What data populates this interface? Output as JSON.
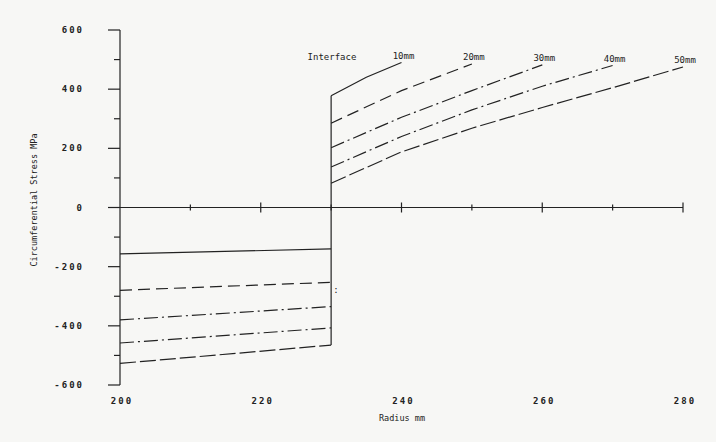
{
  "chart_data": {
    "type": "line",
    "title": "",
    "xlabel": "Radius mm",
    "ylabel": "Circumferential Stress MPa",
    "xlim": [
      200,
      280
    ],
    "ylim": [
      -600,
      600
    ],
    "x_ticks": [
      200,
      210,
      220,
      230,
      240,
      250,
      260,
      270,
      280
    ],
    "x_tick_labels": [
      "200",
      "220",
      "240",
      "260",
      "280"
    ],
    "x_tick_label_values": [
      200,
      220,
      240,
      260,
      280
    ],
    "y_ticks": [
      -600,
      -500,
      -400,
      -300,
      -200,
      -100,
      0,
      100,
      200,
      300,
      400,
      500,
      600
    ],
    "y_tick_labels": [
      "-600",
      "-400",
      "-200",
      "0",
      "200",
      "400",
      "600"
    ],
    "y_tick_label_values": [
      -600,
      -400,
      -200,
      0,
      200,
      400,
      600
    ],
    "grid": false,
    "interface_radius": 230,
    "interface_label": "Interface",
    "series": [
      {
        "name": "10mm",
        "dash": "solid",
        "inner": {
          "x": [
            200,
            230
          ],
          "y": [
            -157,
            -140
          ]
        },
        "outer": {
          "x": [
            230,
            235,
            240
          ],
          "y": [
            378,
            440,
            490
          ]
        }
      },
      {
        "name": "20mm",
        "dash": "dashed",
        "inner": {
          "x": [
            200,
            230
          ],
          "y": [
            -280,
            -253
          ]
        },
        "outer": {
          "x": [
            230,
            240,
            250
          ],
          "y": [
            285,
            395,
            485
          ]
        }
      },
      {
        "name": "30mm",
        "dash": "dash-dot",
        "inner": {
          "x": [
            200,
            230
          ],
          "y": [
            -380,
            -335
          ]
        },
        "outer": {
          "x": [
            230,
            240,
            250,
            260
          ],
          "y": [
            202,
            305,
            395,
            482
          ]
        }
      },
      {
        "name": "40mm",
        "dash": "dash-dot",
        "inner": {
          "x": [
            200,
            230
          ],
          "y": [
            -458,
            -407
          ]
        },
        "outer": {
          "x": [
            230,
            240,
            250,
            260,
            270
          ],
          "y": [
            137,
            240,
            330,
            410,
            480
          ]
        }
      },
      {
        "name": "50mm",
        "dash": "long-dash",
        "inner": {
          "x": [
            200,
            230
          ],
          "y": [
            -527,
            -465
          ]
        },
        "outer": {
          "x": [
            230,
            240,
            250,
            260,
            270,
            280
          ],
          "y": [
            82,
            188,
            268,
            338,
            405,
            475
          ]
        }
      }
    ]
  }
}
